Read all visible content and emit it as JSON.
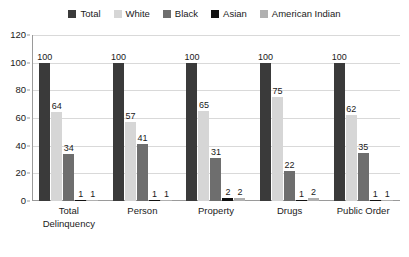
{
  "chart_data": {
    "type": "bar",
    "title": "",
    "subtitle": "",
    "xlabel": "",
    "ylabel": "",
    "ylim": [
      0,
      120
    ],
    "yticks": [
      0,
      20,
      40,
      60,
      80,
      100,
      120
    ],
    "grid": true,
    "legend_position": "top-center",
    "categories": [
      "Total Delinquency",
      "Person",
      "Property",
      "Drugs",
      "Public Order"
    ],
    "category_lines": [
      [
        "Total",
        "Delinquency"
      ],
      [
        "Person"
      ],
      [
        "Property"
      ],
      [
        "Drugs"
      ],
      [
        "Public Order"
      ]
    ],
    "series": [
      {
        "name": "Total",
        "color": "#3a3a3a",
        "values": [
          100,
          100,
          100,
          100,
          100
        ]
      },
      {
        "name": "White",
        "color": "#d6d6d6",
        "values": [
          64,
          57,
          65,
          75,
          62
        ]
      },
      {
        "name": "Black",
        "color": "#6e6e6e",
        "values": [
          34,
          41,
          31,
          22,
          35
        ]
      },
      {
        "name": "Asian",
        "color": "#111111",
        "values": [
          1,
          1,
          2,
          1,
          1
        ]
      },
      {
        "name": "American Indian",
        "color": "#b0b0b0",
        "values": [
          1,
          1,
          2,
          2,
          1
        ]
      }
    ]
  },
  "axis": {
    "tick_labels": [
      "0",
      "20",
      "40",
      "60",
      "80",
      "100",
      "120"
    ]
  }
}
